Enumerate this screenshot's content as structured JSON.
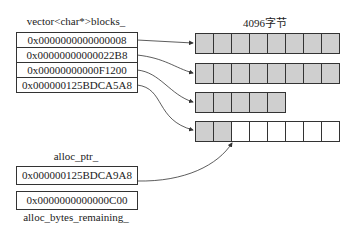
{
  "vector": {
    "label": "vector<char*>blocks_",
    "entries": [
      "0x0000000000000008",
      "0x00000000000022B8",
      "0x00000000000F1200",
      "0x000000125BDCA5A8"
    ]
  },
  "block_size_label": "4096字节",
  "blocks": [
    {
      "used": 8,
      "total": 8
    },
    {
      "used": 8,
      "total": 8
    },
    {
      "used": 5,
      "total": 5
    },
    {
      "used": 2,
      "total": 8
    }
  ],
  "alloc_ptr": {
    "label": "alloc_ptr_",
    "value": "0x000000125BDCA9A8"
  },
  "alloc_bytes_remaining": {
    "label": "alloc_bytes_remaining_",
    "value": "0x0000000000000C00"
  },
  "colors": {
    "used_block": "#cfcfcf",
    "free_block": "#ffffff",
    "stroke": "#333333"
  }
}
